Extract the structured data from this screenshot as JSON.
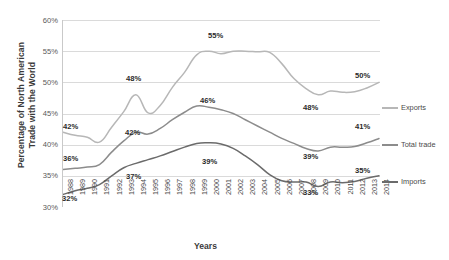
{
  "chart_data": {
    "type": "line",
    "title": "",
    "xlabel": "Years",
    "ylabel": "Percentage of North American Trade with the World",
    "ylabel_line1": "Percentage of North American",
    "ylabel_line2": "Trade with the World",
    "ylim": [
      30,
      60
    ],
    "ytick_values": [
      30,
      35,
      40,
      45,
      50,
      55,
      60
    ],
    "ytick_labels": [
      "30%",
      "35%",
      "40%",
      "45%",
      "50%",
      "55%",
      "60%"
    ],
    "grid": true,
    "legend_position": "right",
    "x": [
      1988,
      1989,
      1990,
      1991,
      1992,
      1993,
      1994,
      1995,
      1996,
      1997,
      1998,
      1999,
      2000,
      2001,
      2002,
      2003,
      2004,
      2005,
      2006,
      2007,
      2008,
      2009,
      2010,
      2011,
      2012,
      2013,
      2014
    ],
    "xtick_labels": [
      "1988",
      "1989",
      "1990",
      "1991",
      "1992",
      "1993",
      "1994",
      "1995",
      "1996",
      "1997",
      "1998",
      "1999",
      "2000",
      "2001",
      "2002",
      "2003",
      "2004",
      "2005",
      "2006",
      "2007",
      "2008",
      "2009",
      "2010",
      "2011",
      "2012",
      "2013",
      "2014"
    ],
    "series": [
      {
        "name": "Exports",
        "color": "#b7b7b7",
        "values": [
          42.0,
          41.5,
          41.2,
          40.4,
          42.8,
          45.3,
          48.0,
          45.1,
          46.3,
          49.2,
          51.6,
          54.4,
          55.0,
          54.6,
          55.0,
          55.0,
          54.9,
          54.8,
          53.0,
          50.6,
          49.0,
          48.0,
          48.6,
          48.4,
          48.5,
          49.1,
          50.0
        ]
      },
      {
        "name": "Total trade",
        "color": "#8c8c8c",
        "values": [
          36.0,
          36.2,
          36.4,
          36.8,
          38.8,
          40.6,
          42.0,
          41.7,
          42.6,
          44.0,
          45.2,
          46.2,
          46.0,
          45.6,
          45.0,
          44.0,
          43.0,
          42.0,
          41.0,
          40.2,
          39.4,
          39.0,
          39.6,
          39.6,
          39.7,
          40.3,
          41.0
        ]
      },
      {
        "name": "Imports",
        "color": "#6b6b6b",
        "values": [
          32.0,
          32.6,
          33.0,
          33.6,
          35.0,
          36.3,
          37.0,
          37.6,
          38.2,
          38.9,
          39.6,
          40.2,
          40.3,
          40.1,
          39.4,
          38.2,
          36.8,
          35.2,
          34.2,
          34.0,
          34.0,
          33.3,
          34.0,
          33.9,
          34.1,
          34.6,
          35.0
        ]
      }
    ],
    "data_labels": [
      {
        "text": "42%",
        "series": "Exports",
        "year": 1988,
        "x": 63,
        "y": 122
      },
      {
        "text": "48%",
        "series": "Exports",
        "year": 1994,
        "x": 126,
        "y": 74
      },
      {
        "text": "55%",
        "series": "Exports",
        "year": 2000,
        "x": 208,
        "y": 31
      },
      {
        "text": "48%",
        "series": "Exports",
        "year": 2009,
        "x": 303,
        "y": 103
      },
      {
        "text": "50%",
        "series": "Exports",
        "year": 2014,
        "x": 355,
        "y": 71
      },
      {
        "text": "36%",
        "series": "Total trade",
        "year": 1988,
        "x": 63,
        "y": 154
      },
      {
        "text": "42%",
        "series": "Total trade",
        "year": 1994,
        "x": 125,
        "y": 128
      },
      {
        "text": "46%",
        "series": "Total trade",
        "year": 1999,
        "x": 200,
        "y": 96
      },
      {
        "text": "39%",
        "series": "Total trade",
        "year": 2009,
        "x": 303,
        "y": 152
      },
      {
        "text": "41%",
        "series": "Total trade",
        "year": 2014,
        "x": 355,
        "y": 122
      },
      {
        "text": "32%",
        "series": "Imports",
        "year": 1988,
        "x": 62,
        "y": 194
      },
      {
        "text": "37%",
        "series": "Imports",
        "year": 1994,
        "x": 126,
        "y": 172
      },
      {
        "text": "39%",
        "series": "Imports",
        "year": 1999,
        "x": 202,
        "y": 157
      },
      {
        "text": "33%",
        "series": "Imports",
        "year": 2009,
        "x": 303,
        "y": 188
      },
      {
        "text": "35%",
        "series": "Imports",
        "year": 2014,
        "x": 355,
        "y": 166
      }
    ],
    "legend": [
      {
        "label": "Exports",
        "color": "#b7b7b7",
        "top": 103
      },
      {
        "label": "Total trade",
        "color": "#8c8c8c",
        "top": 140
      },
      {
        "label": "Imports",
        "color": "#6b6b6b",
        "top": 177
      }
    ]
  }
}
